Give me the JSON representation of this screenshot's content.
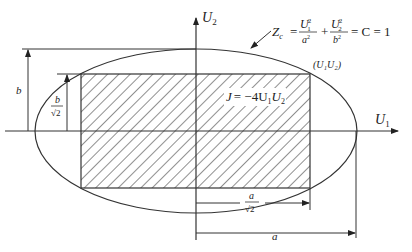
{
  "diagram": {
    "axes": {
      "x_label": "U",
      "x_sub": "1",
      "y_label": "U",
      "y_sub": "2"
    },
    "ellipse_annotation": {
      "z": "Z",
      "z_sub": "c",
      "eq": "=",
      "term1_num": "U",
      "term1_num_sub": "1",
      "term1_num_sup": "2",
      "term1_den": "a",
      "term1_den_sup": "2",
      "plus": "+",
      "term2_num": "U",
      "term2_num_sub": "2",
      "term2_num_sup": "2",
      "term2_den": "b",
      "term2_den_sup": "2",
      "rhs": "= C = 1"
    },
    "corner_point": "(U₁U₂)",
    "rect_label": {
      "j": "J",
      "rhs": "= −4U",
      "s1": "1",
      "u2": "U",
      "s2": "2"
    },
    "dimensions": {
      "b": "b",
      "b_over_sqrt2_num": "b",
      "b_over_sqrt2_den": "√2",
      "a_over_sqrt2_num": "a",
      "a_over_sqrt2_den": "√2",
      "a": "a"
    },
    "colors": {
      "line": "#333333",
      "hatch": "#333333",
      "background": "#ffffff"
    }
  }
}
